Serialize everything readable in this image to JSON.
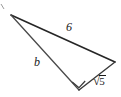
{
  "figure": {
    "kind": "right-triangle-diagram",
    "background_color": "#ffffff",
    "stroke_color": "#262626",
    "vertices": {
      "apex": {
        "x": 11,
        "y": 15
      },
      "right": {
        "x": 115,
        "y": 62
      },
      "bottom": {
        "x": 79,
        "y": 90
      }
    },
    "sides": [
      {
        "name": "hypotenuse",
        "from": "apex",
        "to": "right",
        "label": "6"
      },
      {
        "name": "leg-long",
        "from": "apex",
        "to": "bottom",
        "label": "b"
      },
      {
        "name": "leg-short",
        "from": "bottom",
        "to": "right",
        "label": "5"
      }
    ],
    "right_angle": {
      "at": "bottom",
      "marker": "square"
    },
    "labels": {
      "hypotenuse": "6",
      "leg_b": "b",
      "leg_root_symbol": "√",
      "leg_root_radicand": "5"
    },
    "stray_mark": {
      "x": 2,
      "y": 6
    }
  }
}
